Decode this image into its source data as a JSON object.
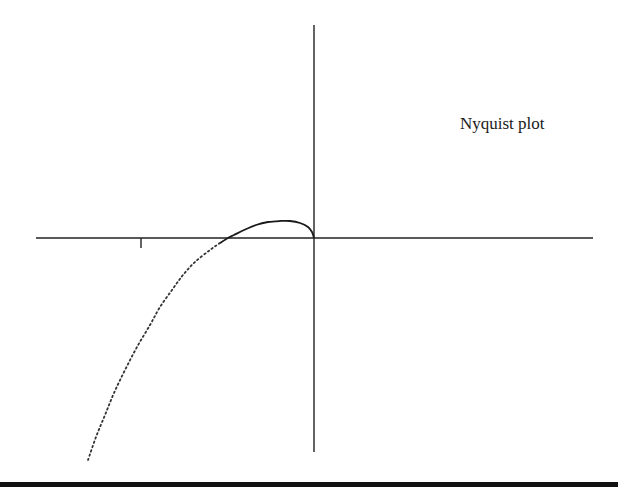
{
  "chart_data": {
    "type": "line",
    "title": "Nyquist plot",
    "xlabel": "",
    "ylabel": "",
    "grid": false,
    "legend": null,
    "annotations": [
      "Nyquist plot"
    ],
    "axes": {
      "real_axis": {
        "x1": 36,
        "x2": 593,
        "y": 238
      },
      "imag_axis": {
        "x": 314,
        "y1": 25,
        "y2": 452
      },
      "ticks": [
        {
          "x": 141,
          "y": 238,
          "label": "",
          "note": "tick at -1 on real axis"
        }
      ]
    },
    "series": [
      {
        "name": "Nyquist curve (solid portion)",
        "style": "solid",
        "points_px": [
          [
            314,
            238
          ],
          [
            312,
            232
          ],
          [
            308,
            227
          ],
          [
            300,
            223
          ],
          [
            290,
            221
          ],
          [
            280,
            221
          ],
          [
            268,
            222
          ],
          [
            256,
            225
          ],
          [
            244,
            230
          ],
          [
            234,
            235
          ],
          [
            228,
            238
          ],
          [
            220,
            243
          ]
        ]
      },
      {
        "name": "Nyquist curve (dotted portion)",
        "style": "dotted",
        "points_px": [
          [
            220,
            243
          ],
          [
            210,
            250
          ],
          [
            195,
            262
          ],
          [
            183,
            275
          ],
          [
            172,
            290
          ],
          [
            160,
            307
          ],
          [
            150,
            325
          ],
          [
            137,
            347
          ],
          [
            125,
            370
          ],
          [
            114,
            393
          ],
          [
            105,
            415
          ],
          [
            96,
            437
          ],
          [
            88,
            460
          ]
        ]
      }
    ],
    "colors": {
      "curve": "#1a1a1a",
      "axes": "#222222",
      "background": "#ffffff"
    }
  }
}
